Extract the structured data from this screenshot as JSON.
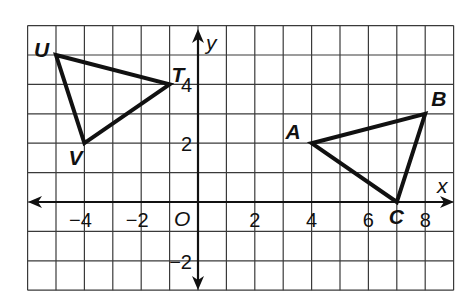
{
  "diagram": {
    "type": "coordinate-plane",
    "x_range": [
      -6,
      9
    ],
    "y_range": [
      -3,
      6
    ],
    "axis_labels": {
      "x": "x",
      "y": "y",
      "origin": "O"
    },
    "x_ticks": [
      {
        "value": -4,
        "label": "−4"
      },
      {
        "value": -2,
        "label": "−2"
      },
      {
        "value": 2,
        "label": "2"
      },
      {
        "value": 4,
        "label": "4"
      },
      {
        "value": 6,
        "label": "6"
      },
      {
        "value": 8,
        "label": "8"
      }
    ],
    "y_ticks": [
      {
        "value": 4,
        "label": "4"
      },
      {
        "value": 2,
        "label": "2"
      },
      {
        "value": -2,
        "label": "−2"
      }
    ],
    "triangles": [
      {
        "name": "UTV",
        "vertices": [
          {
            "label": "U",
            "x": -5,
            "y": 5
          },
          {
            "label": "T",
            "x": -1,
            "y": 4
          },
          {
            "label": "V",
            "x": -4,
            "y": 2
          }
        ]
      },
      {
        "name": "ABC",
        "vertices": [
          {
            "label": "A",
            "x": 4,
            "y": 2
          },
          {
            "label": "B",
            "x": 8,
            "y": 3
          },
          {
            "label": "C",
            "x": 7,
            "y": 0
          }
        ]
      }
    ]
  }
}
